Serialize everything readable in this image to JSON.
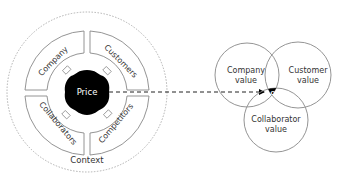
{
  "left_diagram": {
    "context_label": "Context",
    "center_label": "Price",
    "quadrants": [
      {
        "label": "Company",
        "position": "top-left"
      },
      {
        "label": "Customers",
        "position": "top-right"
      },
      {
        "label": "Collaborators",
        "position": "bottom-left"
      },
      {
        "label": "Competitors",
        "position": "bottom-right"
      }
    ]
  },
  "right_diagram": {
    "circles": [
      {
        "line1": "Company",
        "line2": "value"
      },
      {
        "line1": "Customer",
        "line2": "value"
      },
      {
        "line1": "Collaborator",
        "line2": "value"
      }
    ],
    "intersection_label": "OVP"
  },
  "colors": {
    "stroke": "#888888",
    "dashed_outer": "#a0a0a0",
    "fill_dark": "#000000",
    "text": "#333333",
    "text_inverse": "#ffffff"
  }
}
